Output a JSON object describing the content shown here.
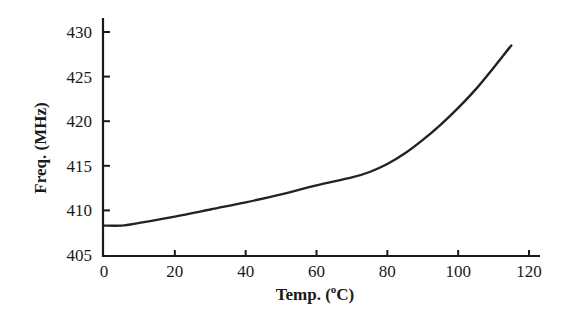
{
  "chart_data": {
    "type": "line",
    "title": "",
    "xlabel": "Temp. (°C)",
    "xlabel_parts": {
      "pre": "Temp. (",
      "sup": "o",
      "post": "C)"
    },
    "ylabel": "Freq. (MHz)",
    "xlim": [
      0,
      120
    ],
    "ylim": [
      405,
      430
    ],
    "xticks": [
      0,
      20,
      40,
      60,
      80,
      100,
      120
    ],
    "yticks": [
      405,
      410,
      415,
      420,
      425,
      430
    ],
    "grid": false,
    "legend": null,
    "series": [
      {
        "name": "Frequency vs Temperature",
        "x": [
          0,
          5,
          10,
          20,
          30,
          40,
          50,
          60,
          70,
          75,
          80,
          85,
          90,
          95,
          100,
          105,
          110,
          115
        ],
        "y": [
          408.3,
          408.3,
          408.6,
          409.3,
          410.1,
          410.9,
          411.8,
          412.8,
          413.7,
          414.3,
          415.2,
          416.4,
          417.9,
          419.6,
          421.5,
          423.6,
          426.0,
          428.5
        ]
      }
    ]
  }
}
